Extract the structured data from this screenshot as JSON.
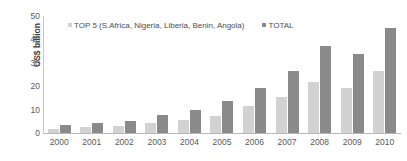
{
  "chart_data": {
    "type": "bar",
    "title": "",
    "xlabel": "",
    "ylabel": "US$ billion",
    "ylim": [
      0,
      50
    ],
    "yticks": [
      "50",
      "40",
      "30",
      "20",
      "10",
      "0"
    ],
    "grid": false,
    "legend_position": "top-inside",
    "categories": [
      "2000",
      "2001",
      "2002",
      "2003",
      "2004",
      "2005",
      "2006",
      "2007",
      "2008",
      "2009",
      "2010"
    ],
    "series": [
      {
        "name": "TOP 5 (S.Africa, Nigeria, Liberia, Benin, Angola)",
        "color": "#d2d2d2",
        "values": [
          1.8,
          2.5,
          2.8,
          4.3,
          5.6,
          7.3,
          11.5,
          15.6,
          22.0,
          19.4,
          26.6
        ]
      },
      {
        "name": "TOTAL",
        "color": "#8a8a8a",
        "values": [
          3.5,
          4.4,
          5.0,
          7.5,
          10.0,
          13.7,
          19.2,
          26.6,
          37.0,
          33.6,
          44.7
        ]
      }
    ]
  },
  "axis": {
    "y_title": "US$ billion"
  },
  "legend": {
    "entries": [
      {
        "label": "TOP 5 (S.Africa, Nigeria, Liberia, Benin, Angola)"
      },
      {
        "label": "TOTAL"
      }
    ]
  }
}
